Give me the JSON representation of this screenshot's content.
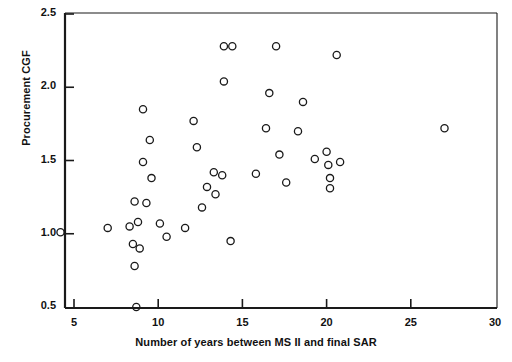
{
  "chart_data": {
    "type": "scatter",
    "title": "",
    "xlabel": "Number of years between MS II and final SAR",
    "ylabel": "Procurement CGF",
    "xlim": [
      3.8,
      30
    ],
    "ylim": [
      0.5,
      2.5
    ],
    "xticks": [
      5,
      10,
      15,
      20,
      25,
      30
    ],
    "yticks": [
      0.5,
      1.0,
      1.5,
      2.0,
      2.5
    ],
    "grid": false,
    "legend": null,
    "marker": "open-circle",
    "points": [
      {
        "x": 4.2,
        "y": 1.01
      },
      {
        "x": 7.0,
        "y": 1.04
      },
      {
        "x": 8.3,
        "y": 1.05
      },
      {
        "x": 8.8,
        "y": 1.08
      },
      {
        "x": 8.6,
        "y": 1.22
      },
      {
        "x": 9.3,
        "y": 1.21
      },
      {
        "x": 8.5,
        "y": 0.93
      },
      {
        "x": 8.9,
        "y": 0.9
      },
      {
        "x": 8.6,
        "y": 0.78
      },
      {
        "x": 8.7,
        "y": 0.5
      },
      {
        "x": 9.1,
        "y": 1.49
      },
      {
        "x": 9.1,
        "y": 1.85
      },
      {
        "x": 9.5,
        "y": 1.64
      },
      {
        "x": 9.6,
        "y": 1.38
      },
      {
        "x": 10.1,
        "y": 1.07
      },
      {
        "x": 10.5,
        "y": 0.98
      },
      {
        "x": 11.6,
        "y": 1.04
      },
      {
        "x": 12.1,
        "y": 1.77
      },
      {
        "x": 12.3,
        "y": 1.59
      },
      {
        "x": 12.9,
        "y": 1.32
      },
      {
        "x": 12.6,
        "y": 1.18
      },
      {
        "x": 13.3,
        "y": 1.42
      },
      {
        "x": 13.4,
        "y": 1.27
      },
      {
        "x": 13.8,
        "y": 1.4
      },
      {
        "x": 13.9,
        "y": 2.04
      },
      {
        "x": 13.9,
        "y": 2.28
      },
      {
        "x": 14.4,
        "y": 2.28
      },
      {
        "x": 14.3,
        "y": 0.95
      },
      {
        "x": 15.8,
        "y": 1.41
      },
      {
        "x": 16.4,
        "y": 1.72
      },
      {
        "x": 16.6,
        "y": 1.96
      },
      {
        "x": 17.0,
        "y": 2.28
      },
      {
        "x": 17.2,
        "y": 1.54
      },
      {
        "x": 17.6,
        "y": 1.35
      },
      {
        "x": 18.3,
        "y": 1.7
      },
      {
        "x": 18.6,
        "y": 1.9
      },
      {
        "x": 19.3,
        "y": 1.51
      },
      {
        "x": 20.0,
        "y": 1.56
      },
      {
        "x": 20.1,
        "y": 1.47
      },
      {
        "x": 20.2,
        "y": 1.38
      },
      {
        "x": 20.2,
        "y": 1.31
      },
      {
        "x": 20.6,
        "y": 2.22
      },
      {
        "x": 20.8,
        "y": 1.49
      },
      {
        "x": 27.0,
        "y": 1.72
      }
    ]
  },
  "axis": {
    "x_tick_labels": [
      "5",
      "10",
      "15",
      "20",
      "25",
      "30"
    ],
    "y_tick_labels": [
      "0.5",
      "1.0",
      "1.5",
      "2.0",
      "2.5"
    ]
  },
  "colors": {
    "axis": "#1a1a1a",
    "marker_stroke": "#1a1a1a",
    "background": "#ffffff"
  }
}
